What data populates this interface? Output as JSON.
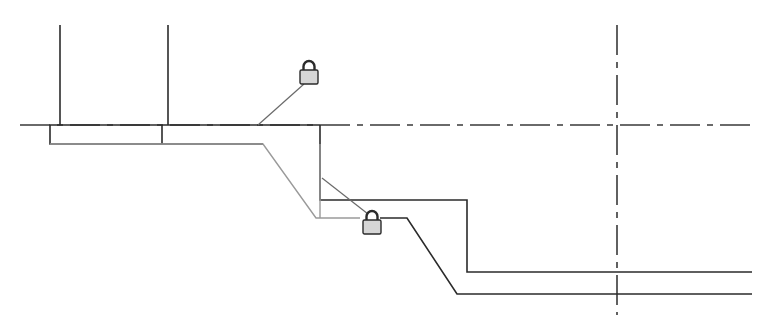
{
  "diagram": {
    "type": "cad-sketch-profile",
    "colors": {
      "background": "#ffffff",
      "line_dark": "#2b2b2b",
      "line_gray": "#9a9a9a",
      "lock_fill": "#d6d6d6"
    },
    "reference_lines": [
      {
        "name": "horizontal-reference",
        "orientation": "horizontal",
        "style": "dash-dot",
        "y": 125,
        "x1": 20,
        "x2": 752
      },
      {
        "name": "vertical-reference",
        "orientation": "vertical",
        "style": "dash-dot",
        "x": 617,
        "y1": 25,
        "y2": 315
      }
    ],
    "wall_lines": [
      {
        "name": "wall-line-left",
        "x": 60,
        "y1": 25,
        "y2": 125
      },
      {
        "name": "wall-line-right",
        "x": 168,
        "y1": 25,
        "y2": 125
      }
    ],
    "footing": {
      "x1": 50,
      "y1": 125,
      "x2": 320,
      "y2": 144,
      "divider_x": 162
    },
    "profiles": [
      {
        "name": "gray-slope-profile",
        "style": "gray",
        "points": "50,144 263,144 316,218 360,218"
      },
      {
        "name": "upper-step-profile",
        "style": "dark",
        "points": "320,125 320,200 467,200 467,272 752,272"
      },
      {
        "name": "lower-step-profile",
        "style": "dark",
        "points": "380,218 407,218 457,294 752,294"
      },
      {
        "name": "gray-vertical-edge",
        "style": "gray",
        "points": "320,144 320,218"
      }
    ],
    "locks": [
      {
        "name": "lock-icon-top",
        "icon": "padlock-icon",
        "x": 299,
        "y": 60,
        "leader": "304,84 258,125"
      },
      {
        "name": "lock-icon-bottom",
        "icon": "padlock-icon",
        "x": 362,
        "y": 210,
        "leader": "322,178 368,214"
      }
    ]
  }
}
